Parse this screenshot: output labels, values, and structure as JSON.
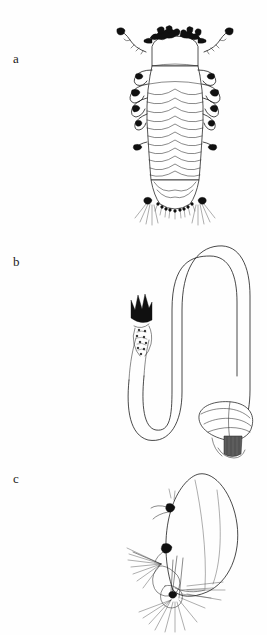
{
  "plate": {
    "width": 267,
    "height": 635,
    "background_color": "#fefefe",
    "ink_color": "#1c1c1c",
    "style": "scientific line drawing / stipple ink illustration",
    "subject": "annelid (polychaete) morphology plate"
  },
  "panels": [
    {
      "label": "a",
      "label_x": 13,
      "label_y": 58,
      "name": "panel-a-dorsal-whole-body",
      "description": "dorsal view of segmented worm body with paired head appendages, lateral parapodia and posterior setal fringe",
      "figure_box": {
        "x": 118,
        "y": 20,
        "width": 116,
        "height": 215
      }
    },
    {
      "label": "b",
      "label_x": 13,
      "label_y": 262,
      "name": "panel-b-sinuous-tube",
      "description": "lateral view of sinuous S-curved tube/gut with dark crown-shaped jaw apparatus at left terminus and bulbous shaded sac at lower right",
      "figure_box": {
        "x": 105,
        "y": 245,
        "width": 145,
        "height": 220
      }
    },
    {
      "label": "c",
      "label_x": 13,
      "label_y": 477,
      "name": "panel-c-parapodium-detail",
      "description": "detail of a single parapodium / ovoid lobe with branching setal bundles at its base",
      "figure_box": {
        "x": 130,
        "y": 465,
        "width": 110,
        "height": 160
      }
    }
  ],
  "colors": {
    "ink": "#1c1c1c",
    "ink_thin": "#2a2a2a",
    "solid_black": "#101010",
    "shade_gray": "#5d5d5d",
    "shade_light": "#cfcfcf",
    "paper": "#fefefe"
  }
}
